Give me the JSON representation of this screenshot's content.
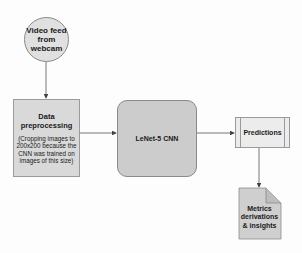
{
  "diagram": {
    "nodes": {
      "webcam": {
        "label": "Video feed from webcam",
        "shape": "circle"
      },
      "preprocessing": {
        "title": "Data preprocessing",
        "subtitle": "(Cropping images to 200x200 because the CNN was trained on images of this size)",
        "shape": "rectangle"
      },
      "cnn": {
        "label": "LeNet-5 CNN",
        "shape": "rounded-rectangle"
      },
      "predictions": {
        "label": "Predictions",
        "shape": "process"
      },
      "metrics": {
        "label": "Metrics derivations & insights",
        "shape": "document"
      }
    },
    "edges": [
      {
        "from": "webcam",
        "to": "preprocessing"
      },
      {
        "from": "preprocessing",
        "to": "cnn"
      },
      {
        "from": "cnn",
        "to": "predictions"
      },
      {
        "from": "predictions",
        "to": "metrics"
      }
    ],
    "colors": {
      "fill_light": "#e0e0e0",
      "fill_mid": "#d9d9d9",
      "fill_dark": "#cccccc",
      "stroke": "#8a8a8a",
      "arrow": "#444444"
    }
  }
}
